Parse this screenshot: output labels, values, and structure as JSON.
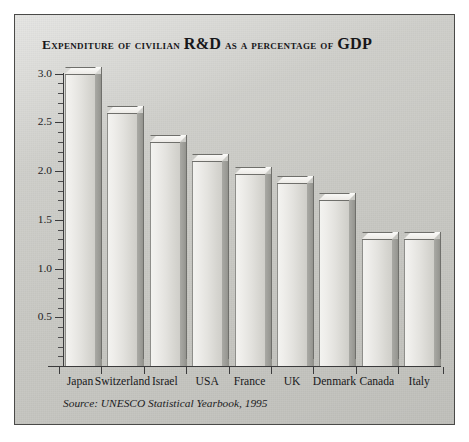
{
  "figure": {
    "title_main": "Expenditure of civilian ",
    "title_rd": "R&D",
    "title_mid": " as a percentage of ",
    "title_gdp": "GDP",
    "title_full": "Expenditure of civilian R&D as a percentage of GDP",
    "source": "Source: UNESCO Statistical Yearbook, 1995",
    "panel_color": "#c9c9c4",
    "bar_face_color": "#e9e8e4",
    "bar_side_color": "#9b9b96",
    "axis_color": "#3b3b3c",
    "text_color": "#19191b"
  },
  "chart_data": {
    "type": "bar",
    "title": "Expenditure of civilian R&D as a percentage of GDP",
    "xlabel": "",
    "ylabel": "",
    "ylim": [
      0,
      3.1
    ],
    "grid": false,
    "legend": null,
    "categories": [
      "Japan",
      "Switzerland",
      "Israel",
      "USA",
      "France",
      "UK",
      "Denmark",
      "Canada",
      "Italy"
    ],
    "values": [
      3.0,
      2.6,
      2.3,
      2.1,
      1.97,
      1.88,
      1.7,
      1.3,
      1.3
    ],
    "ytick_labels": [
      "3.0",
      "2.5",
      "2.0",
      "1.5",
      "1.0",
      "0.5"
    ],
    "ytick_values": [
      3.0,
      2.5,
      2.0,
      1.5,
      1.0,
      0.5
    ],
    "minor_tick_step": 0.1,
    "note": "Source: UNESCO Statistical Yearbook, 1995"
  }
}
